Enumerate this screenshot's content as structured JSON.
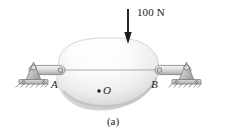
{
  "figure": {
    "caption": "(a)",
    "background_color": "#ffffff",
    "ink_color": "#1a1a1a",
    "body_fill_light": "#fcfcfc",
    "body_fill_shadow": "#b9babb",
    "metal_fill": "#c9cacb",
    "metal_stroke": "#6f7173"
  },
  "load": {
    "label": "100 N",
    "arrow_direction": "down",
    "arrow_x": 128,
    "arrow_y_start": 9,
    "arrow_y_end": 44
  },
  "points": [
    {
      "id": "A",
      "label": "A",
      "x": 63,
      "y": 70
    },
    {
      "id": "B",
      "label": "B",
      "x": 156,
      "y": 70
    },
    {
      "id": "O",
      "label": "O",
      "x": 98,
      "y": 90
    }
  ],
  "supports": [
    {
      "id": "left-pin-support",
      "side": "left",
      "type": "pin",
      "x": 28,
      "y": 70
    },
    {
      "id": "right-pin-support",
      "side": "right",
      "type": "pin",
      "x": 193,
      "y": 70
    }
  ],
  "links": [
    {
      "id": "left-link",
      "from": "left-pin-support",
      "to": "A"
    },
    {
      "id": "right-link",
      "from": "B",
      "to": "right-pin-support"
    }
  ],
  "body": {
    "id": "rigid-body",
    "description": "irregular shaded rigid body"
  },
  "chord": {
    "id": "ab-chord",
    "from": "A",
    "to": "B"
  }
}
